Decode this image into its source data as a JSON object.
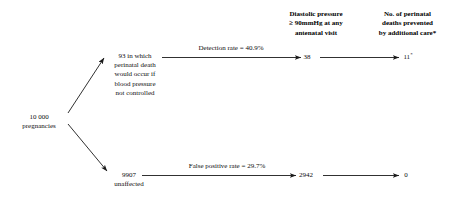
{
  "diagram": {
    "type": "flowchart",
    "title_headers": [
      {
        "id": "header-diastolic",
        "text": "Diastolic pressure\n≥ 90mmHg at any\nantenatal visit"
      },
      {
        "id": "header-prevented",
        "text": "No. of perinatal\ndeaths prevented\nby additional care*"
      }
    ],
    "nodes": {
      "root": {
        "label": "10 000\npregnancies",
        "value": "10 000",
        "description": "pregnancies"
      },
      "affected": {
        "label": "93 in which\nperinatal death\nwould occur if\nblood pressure\nnot controlled",
        "value": "93"
      },
      "unaffected": {
        "label": "9907\nunaffected",
        "value": "9907",
        "description": "unaffected"
      },
      "detected": {
        "value": "38"
      },
      "prevented": {
        "value": "11",
        "footnote_marker": "*"
      },
      "false_positive": {
        "value": "2942"
      },
      "prevented_fp": {
        "value": "0"
      }
    },
    "edges": [
      {
        "id": "edge-detection-rate",
        "label": "Detection rate = 40.9%",
        "rate": "40.9%"
      },
      {
        "id": "edge-false-positive-rate",
        "label": "False positive rate = 29.7%",
        "rate": "29.7%"
      }
    ],
    "colors": {
      "text": "#0d0d0d",
      "line": "#1a1a1a",
      "background": "#ffffff"
    }
  }
}
